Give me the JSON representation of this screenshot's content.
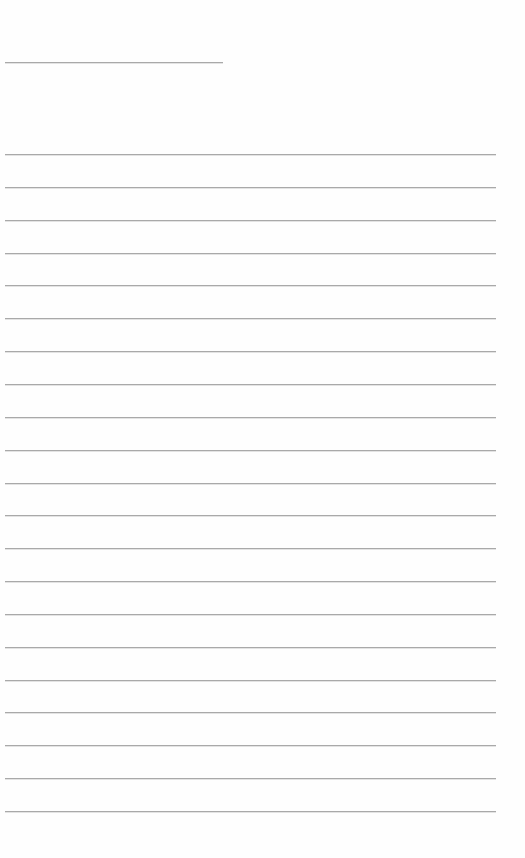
{
  "page": {
    "type": "lined-sheet",
    "background_color": "#ffffff",
    "line_color": "#a9a9a9"
  },
  "title_line": {
    "text": "",
    "top": 62,
    "left": 5,
    "width": 218
  },
  "ruled_lines": {
    "count": 21,
    "first_top": 154,
    "spacing": 32.85,
    "left": 5,
    "width": 491,
    "entries": [
      "",
      "",
      "",
      "",
      "",
      "",
      "",
      "",
      "",
      "",
      "",
      "",
      "",
      "",
      "",
      "",
      "",
      "",
      "",
      "",
      ""
    ]
  }
}
